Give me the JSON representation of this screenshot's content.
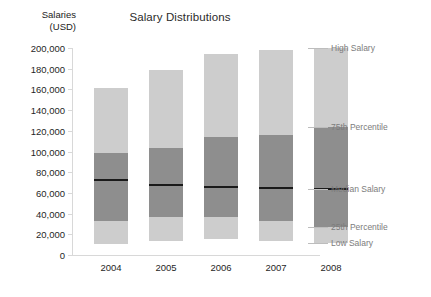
{
  "chart_data": {
    "type": "bar",
    "title": "Salary Distributions",
    "xlabel": "",
    "ylabel": "Salaries (USD)",
    "ylabel_line1": "Salaries",
    "ylabel_line2": "(USD)",
    "categories": [
      "2004",
      "2005",
      "2006",
      "2007",
      "2008"
    ],
    "ylim": [
      0,
      200000
    ],
    "yticks": [
      0,
      20000,
      40000,
      60000,
      80000,
      100000,
      120000,
      140000,
      160000,
      180000,
      200000
    ],
    "ytick_labels": [
      "0",
      "20,000",
      "40,000",
      "60,000",
      "80,000",
      "100,000",
      "120,000",
      "140,000",
      "160,000",
      "180,000",
      "200,000"
    ],
    "grid": false,
    "legend_position": "right-annotations",
    "annotations": [
      {
        "label": "High Salary",
        "value": 200000
      },
      {
        "label": "75th Percentile",
        "value": 124000
      },
      {
        "label": "Median Salary",
        "value": 64000
      },
      {
        "label": "25th Percentile",
        "value": 27000
      },
      {
        "label": "Low Salary",
        "value": 12000
      }
    ],
    "series": [
      {
        "name": "Low Salary",
        "values": [
          11000,
          14000,
          15000,
          14000,
          12000
        ]
      },
      {
        "name": "25th Percentile",
        "values": [
          33000,
          37000,
          37000,
          33000,
          27000
        ]
      },
      {
        "name": "Median Salary",
        "values": [
          72000,
          68000,
          66000,
          65000,
          64000
        ]
      },
      {
        "name": "75th Percentile",
        "values": [
          99000,
          103000,
          114000,
          116000,
          124000
        ]
      },
      {
        "name": "High Salary",
        "values": [
          161000,
          179000,
          194000,
          198000,
          200000
        ]
      }
    ],
    "colors": {
      "outer_band": "#cdcdcd",
      "inner_band": "#8e8e8e",
      "median_line": "#1a1a1a",
      "axis": "#d8d8d8",
      "text": "#1f1f1f",
      "annotation_text": "#7c7c7c",
      "background": "#ffffff"
    }
  }
}
